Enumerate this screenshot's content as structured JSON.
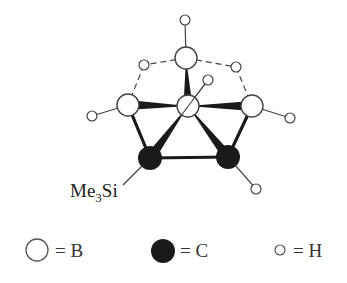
{
  "diagram": {
    "title": "",
    "colors": {
      "boron": "#ffffff",
      "carbon": "#1a1a1a",
      "hydrogen": "#ffffff",
      "stroke": "#222222"
    },
    "substituent_label": {
      "main": "Me",
      "sub": "3",
      "tail": "Si"
    },
    "atoms": [
      {
        "id": "B1",
        "element": "B",
        "role": "apical"
      },
      {
        "id": "B2",
        "element": "B",
        "role": "central"
      },
      {
        "id": "B3",
        "element": "B",
        "role": "basal-left"
      },
      {
        "id": "B4",
        "element": "B",
        "role": "basal-right"
      },
      {
        "id": "C1",
        "element": "C",
        "role": "carbon-left",
        "substituent": "SiMe3"
      },
      {
        "id": "C2",
        "element": "C",
        "role": "carbon-right"
      },
      {
        "id": "H1",
        "element": "H",
        "role": "terminal",
        "bonded_to": "B1"
      },
      {
        "id": "H2",
        "element": "H",
        "role": "terminal",
        "bonded_to": "B2"
      },
      {
        "id": "H3",
        "element": "H",
        "role": "terminal",
        "bonded_to": "B3"
      },
      {
        "id": "H4",
        "element": "H",
        "role": "terminal",
        "bonded_to": "B4"
      },
      {
        "id": "H5",
        "element": "H",
        "role": "terminal",
        "bonded_to": "C2"
      },
      {
        "id": "Hb1",
        "element": "H",
        "role": "bridging",
        "bridges": [
          "B1",
          "B3"
        ]
      },
      {
        "id": "Hb2",
        "element": "H",
        "role": "bridging",
        "bridges": [
          "B1",
          "B4"
        ]
      }
    ],
    "bonds": [
      {
        "from": "B1",
        "to": "B2",
        "style": "wedge"
      },
      {
        "from": "B2",
        "to": "B3",
        "style": "wedge"
      },
      {
        "from": "B2",
        "to": "B4",
        "style": "wedge"
      },
      {
        "from": "B2",
        "to": "C1",
        "style": "wedge"
      },
      {
        "from": "B2",
        "to": "C2",
        "style": "wedge"
      },
      {
        "from": "B3",
        "to": "C1",
        "style": "bold"
      },
      {
        "from": "B4",
        "to": "C2",
        "style": "bold"
      },
      {
        "from": "C1",
        "to": "C2",
        "style": "bold"
      },
      {
        "from": "B1",
        "to": "H1",
        "style": "line"
      },
      {
        "from": "B2",
        "to": "H2",
        "style": "line"
      },
      {
        "from": "B3",
        "to": "H3",
        "style": "line"
      },
      {
        "from": "B4",
        "to": "H4",
        "style": "line"
      },
      {
        "from": "C2",
        "to": "H5",
        "style": "line"
      },
      {
        "from": "B1",
        "to": "Hb1",
        "style": "dashed"
      },
      {
        "from": "Hb1",
        "to": "B3",
        "style": "dashed"
      },
      {
        "from": "B1",
        "to": "Hb2",
        "style": "dashed"
      },
      {
        "from": "Hb2",
        "to": "B4",
        "style": "dashed"
      }
    ],
    "legend": [
      {
        "element": "B",
        "symbol": "open-large-circle",
        "text": "= B"
      },
      {
        "element": "C",
        "symbol": "filled-circle",
        "text": "= C"
      },
      {
        "element": "H",
        "symbol": "open-small-circle",
        "text": "= H"
      }
    ]
  }
}
